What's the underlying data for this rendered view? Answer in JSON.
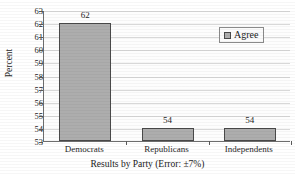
{
  "chart_data": {
    "type": "bar",
    "title": "",
    "title_cropped": true,
    "categories": [
      "Democrats",
      "Republicans",
      "Independents"
    ],
    "values": [
      62,
      54,
      54
    ],
    "data_labels": [
      "62",
      "54",
      "54"
    ],
    "series": [
      {
        "name": "Agree",
        "values": [
          62,
          54,
          54
        ],
        "color": "#adadad"
      }
    ],
    "xlabel": "Results by Party (Error: ±7%)",
    "ylabel": "Percent",
    "ylim": [
      53,
      63
    ],
    "ytick_step": 1,
    "ytick_labels": [
      "63",
      "62",
      "61",
      "60",
      "59",
      "58",
      "57",
      "56",
      "55",
      "54",
      "53"
    ],
    "grid": true,
    "grid_axis": "y",
    "legend": {
      "position": "upper-right-inside",
      "entries": [
        {
          "label": "Agree",
          "swatch_color": "#adadad"
        }
      ]
    },
    "error_note": "Error: ±7%"
  },
  "colors": {
    "bar_fill": "#adadad",
    "bar_border": "#4a4a4a",
    "gridline": "#d8d8d8",
    "axis_line": "#6d6d6d",
    "plot_background": "#fdfdfd",
    "page_background": "#ffffff",
    "text": "#1a1a1a"
  }
}
